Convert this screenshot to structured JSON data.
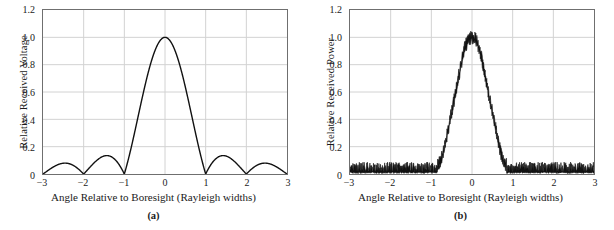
{
  "figure": {
    "panels": [
      {
        "caption": "(a)",
        "ylabel": "Relative Received Voltage",
        "xlabel": "Angle Relative to Boresight (Rayleigh widths)",
        "yticks": [
          "0",
          "0.2",
          "0.4",
          "0.6",
          "0.8",
          "1.0",
          "1.2"
        ],
        "xticks": [
          "−3",
          "−2",
          "−1",
          "0",
          "1",
          "2",
          "3"
        ]
      },
      {
        "caption": "(b)",
        "ylabel": "Relative Received Power",
        "xlabel": "Angle Relative to Boresight (Rayleigh widths)",
        "yticks": [
          "0",
          "0.2",
          "0.4",
          "0.6",
          "0.8",
          "1.0",
          "1.2"
        ],
        "xticks": [
          "−3",
          "−2",
          "−1",
          "0",
          "1",
          "2",
          "3"
        ]
      }
    ]
  },
  "colors": {
    "curve": "#111111",
    "grid": "#d2d2d2",
    "frame": "#6f6f6f",
    "background": "#ffffff"
  },
  "chart_data": [
    {
      "type": "line",
      "title": "(a)",
      "xlabel": "Angle Relative to Boresight (Rayleigh widths)",
      "ylabel": "Relative Received Voltage",
      "xlim": [
        -3,
        3
      ],
      "ylim": [
        0,
        1.2
      ],
      "xticks": [
        -3,
        -2,
        -1,
        0,
        1,
        2,
        3
      ],
      "yticks": [
        0,
        0.2,
        0.4,
        0.6,
        0.8,
        1.0,
        1.2
      ],
      "grid": true,
      "legend": null,
      "description": "Magnitude of a sinc-like antenna voltage pattern: main lobe peaking at 1.0 at boresight, first nulls near x = +/-1, first sidelobes about 0.045 near x = +/-1.4, second sidelobes about 0.017 near x = +/-2.4.",
      "series": [
        {
          "name": "Relative Received Voltage",
          "x": [
            -3.0,
            -2.9,
            -2.8,
            -2.7,
            -2.6,
            -2.5,
            -2.4,
            -2.3,
            -2.2,
            -2.1,
            -2.0,
            -1.9,
            -1.8,
            -1.7,
            -1.6,
            -1.5,
            -1.4,
            -1.3,
            -1.2,
            -1.1,
            -1.0,
            -0.9,
            -0.8,
            -0.7,
            -0.6,
            -0.5,
            -0.4,
            -0.3,
            -0.2,
            -0.1,
            0.0,
            0.1,
            0.2,
            0.3,
            0.4,
            0.5,
            0.6,
            0.7,
            0.8,
            0.9,
            1.0,
            1.1,
            1.2,
            1.3,
            1.4,
            1.5,
            1.6,
            1.7,
            1.8,
            1.9,
            2.0,
            2.1,
            2.2,
            2.3,
            2.4,
            2.5,
            2.6,
            2.7,
            2.8,
            2.9,
            3.0
          ],
          "y": [
            0.0,
            0.009,
            0.015,
            0.017,
            0.017,
            0.013,
            0.008,
            0.003,
            0.0,
            0.005,
            0.011,
            0.02,
            0.029,
            0.037,
            0.043,
            0.045,
            0.044,
            0.038,
            0.029,
            0.016,
            0.0,
            0.019,
            0.042,
            0.071,
            0.126,
            0.214,
            0.339,
            0.503,
            0.691,
            0.871,
            1.0,
            0.871,
            0.691,
            0.503,
            0.339,
            0.214,
            0.126,
            0.071,
            0.042,
            0.019,
            0.0,
            0.016,
            0.029,
            0.038,
            0.044,
            0.045,
            0.043,
            0.037,
            0.029,
            0.02,
            0.011,
            0.005,
            0.0,
            0.003,
            0.008,
            0.013,
            0.017,
            0.017,
            0.015,
            0.009,
            0.0
          ]
        }
      ]
    },
    {
      "type": "line",
      "title": "(b)",
      "xlabel": "Angle Relative to Boresight (Rayleigh widths)",
      "ylabel": "Relative Received Power",
      "xlim": [
        -3,
        3
      ],
      "ylim": [
        0,
        1.2
      ],
      "xticks": [
        -3,
        -2,
        -1,
        0,
        1,
        2,
        3
      ],
      "yticks": [
        0,
        0.2,
        0.4,
        0.6,
        0.8,
        1.0,
        1.2
      ],
      "grid": true,
      "legend": null,
      "description": "Noisy received power pattern. Main lobe peaks near 1.0 (noise excursions to about 1.05) at boresight, falls to the noise floor near x = +/-0.85. Outside the main lobe the trace is a dense noise band between about 0.005 and 0.09, slightly higher around x = +/-1.4 where the sidelobes lie.",
      "series": [
        {
          "name": "Relative Received Power (mean envelope)",
          "x": [
            -3.0,
            -2.8,
            -2.6,
            -2.4,
            -2.2,
            -2.0,
            -1.8,
            -1.6,
            -1.4,
            -1.2,
            -1.0,
            -0.9,
            -0.8,
            -0.7,
            -0.6,
            -0.5,
            -0.4,
            -0.3,
            -0.2,
            -0.1,
            0.0,
            0.1,
            0.2,
            0.3,
            0.4,
            0.5,
            0.6,
            0.7,
            0.8,
            0.9,
            1.0,
            1.2,
            1.4,
            1.6,
            1.8,
            2.0,
            2.2,
            2.4,
            2.6,
            2.8,
            3.0
          ],
          "y": [
            0.04,
            0.042,
            0.045,
            0.043,
            0.04,
            0.042,
            0.047,
            0.052,
            0.056,
            0.05,
            0.045,
            0.05,
            0.08,
            0.16,
            0.3,
            0.45,
            0.6,
            0.75,
            0.9,
            0.98,
            1.0,
            0.98,
            0.9,
            0.75,
            0.6,
            0.45,
            0.3,
            0.16,
            0.08,
            0.05,
            0.045,
            0.05,
            0.056,
            0.052,
            0.047,
            0.042,
            0.04,
            0.043,
            0.045,
            0.042,
            0.04
          ]
        },
        {
          "name": "Noise band half-width",
          "x": [
            -3.0,
            -1.0,
            -0.85,
            0.0,
            0.85,
            1.0,
            3.0
          ],
          "y": [
            0.04,
            0.04,
            0.03,
            0.05,
            0.03,
            0.04,
            0.04
          ]
        }
      ]
    }
  ]
}
